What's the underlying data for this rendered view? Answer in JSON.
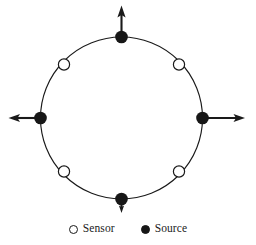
{
  "figure": {
    "background_color": "#ffffff",
    "stroke_color": "#1a1a1a",
    "source_fill": "#171717",
    "sensor_fill": "#ffffff"
  },
  "diagram": {
    "type": "ring-sensor-source-layout",
    "ring": {
      "center_x": 121.5,
      "center_y": 118,
      "radius": 81,
      "stroke_width": 1.1
    },
    "sources": [
      {
        "label": "Source",
        "position": "top",
        "angle_deg": 90,
        "x": 121.5,
        "y": 37,
        "radius": 6.2,
        "arrow": {
          "direction": "up",
          "from_x": 121.5,
          "from_y": 37,
          "to_x": 121.5,
          "to_y": 6
        }
      },
      {
        "label": "Source",
        "position": "right",
        "angle_deg": 0,
        "x": 202.5,
        "y": 118,
        "radius": 6.2,
        "arrow": {
          "direction": "right",
          "from_x": 202.5,
          "from_y": 118,
          "to_x": 245,
          "to_y": 118
        }
      },
      {
        "label": "Source",
        "position": "bottom",
        "angle_deg": 270,
        "x": 121.5,
        "y": 199,
        "radius": 6.2,
        "arrow": {
          "direction": "down",
          "from_x": 121.5,
          "from_y": 199,
          "to_x": 121.5,
          "to_y": 212
        }
      },
      {
        "label": "Source",
        "position": "left",
        "angle_deg": 180,
        "x": 40.5,
        "y": 118,
        "radius": 6.2,
        "arrow": {
          "direction": "left",
          "from_x": 40.5,
          "from_y": 118,
          "to_x": 9,
          "to_y": 118
        }
      }
    ],
    "sensors": [
      {
        "label": "Sensor",
        "position": "upper-left",
        "angle_deg": 135,
        "x": 64,
        "y": 64.5,
        "radius": 5.6
      },
      {
        "label": "Sensor",
        "position": "upper-right",
        "angle_deg": 45,
        "x": 179,
        "y": 64.5,
        "radius": 5.6
      },
      {
        "label": "Sensor",
        "position": "lower-right",
        "angle_deg": 315,
        "x": 179,
        "y": 171.5,
        "radius": 5.6
      },
      {
        "label": "Sensor",
        "position": "lower-left",
        "angle_deg": 225,
        "x": 64,
        "y": 171.5,
        "radius": 5.6
      }
    ],
    "counts": {
      "sources": 4,
      "sensors": 4
    }
  },
  "legend": {
    "items": [
      {
        "label": "Sensor",
        "marker": "hollow-circle-icon",
        "style": "hollow"
      },
      {
        "label": "Source",
        "marker": "filled-circle-icon",
        "style": "filled"
      }
    ]
  }
}
